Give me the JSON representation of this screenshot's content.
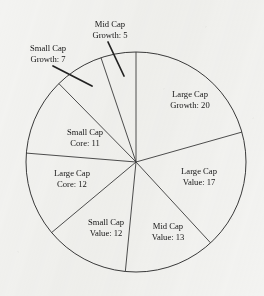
{
  "chart_data": {
    "type": "pie",
    "title": "",
    "xlabel": "",
    "ylabel": "",
    "total": 97,
    "start_angle_deg": 0,
    "direction": "clockwise",
    "legend": "none",
    "grid": false,
    "categories": [
      "Large Cap Growth",
      "Large Cap Value",
      "Mid Cap Value",
      "Small Cap Value",
      "Large Cap Core",
      "Small Cap Core",
      "Small Cap Growth",
      "Mid Cap Growth"
    ],
    "values": [
      20,
      17,
      13,
      12,
      12,
      11,
      7,
      5
    ],
    "slices": [
      {
        "name": "large-cap-growth",
        "line1": "Large Cap",
        "line2": "Growth: 20",
        "value": 20,
        "label_x": 190,
        "label_y": 97,
        "label_anchor": "middle",
        "callout": false
      },
      {
        "name": "large-cap-value",
        "line1": "Large Cap",
        "line2": "Value: 17",
        "value": 17,
        "label_x": 199,
        "label_y": 174,
        "label_anchor": "middle",
        "callout": false
      },
      {
        "name": "mid-cap-value",
        "line1": "Mid Cap",
        "line2": "Value: 13",
        "value": 13,
        "label_x": 168,
        "label_y": 229,
        "label_anchor": "middle",
        "callout": false
      },
      {
        "name": "small-cap-value",
        "line1": "Small Cap",
        "line2": "Value: 12",
        "value": 12,
        "label_x": 106,
        "label_y": 225,
        "label_anchor": "middle",
        "callout": false
      },
      {
        "name": "large-cap-core",
        "line1": "Large Cap",
        "line2": "Core: 12",
        "value": 12,
        "label_x": 72,
        "label_y": 176,
        "label_anchor": "middle",
        "callout": false
      },
      {
        "name": "small-cap-core",
        "line1": "Small Cap",
        "line2": "Core: 11",
        "value": 11,
        "label_x": 85,
        "label_y": 135,
        "label_anchor": "middle",
        "callout": false
      },
      {
        "name": "small-cap-growth",
        "line1": "Small Cap",
        "line2": "Growth: 7",
        "value": 7,
        "label_x": 48,
        "label_y": 51,
        "label_anchor": "middle",
        "callout": true,
        "leader_x1": 53,
        "leader_y1": 66,
        "leader_x2": 92,
        "leader_y2": 86
      },
      {
        "name": "mid-cap-growth",
        "line1": "Mid Cap",
        "line2": "Growth: 5",
        "value": 5,
        "label_x": 110,
        "label_y": 27,
        "label_anchor": "middle",
        "callout": true,
        "leader_x1": 108,
        "leader_y1": 42,
        "leader_x2": 124,
        "leader_y2": 76
      }
    ],
    "geometry": {
      "center_x": 136,
      "center_y": 162,
      "radius": 110
    }
  }
}
